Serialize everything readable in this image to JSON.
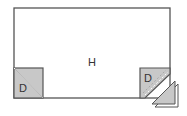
{
  "diagram": {
    "type": "quilt-block-assembly",
    "main_piece": {
      "label": "H",
      "fill": "#ffffff",
      "stroke": "#555555"
    },
    "corner_pieces": [
      {
        "label": "D",
        "position": "bottom-left",
        "fill": "#c8c8c8",
        "diagonal": "top-left to bottom-right"
      },
      {
        "label": "D",
        "position": "bottom-right",
        "fill": "#c8c8c8",
        "stitch_line": "dashed diagonal",
        "corner_trimmed": true
      }
    ],
    "trimmed_triangle": {
      "fill": "#c8c8c8",
      "layers": 2
    },
    "colors": {
      "outline": "#555555",
      "fabric_gray": "#c8c8c8",
      "dash": "#777777"
    }
  }
}
